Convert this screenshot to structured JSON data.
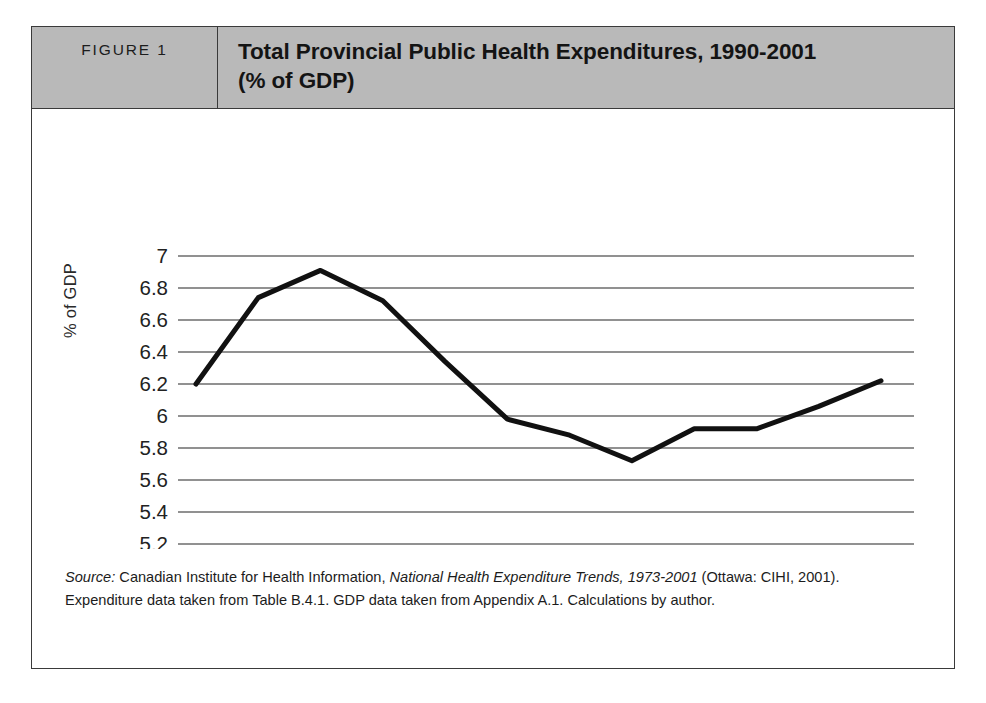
{
  "figure": {
    "label": "FIGURE 1",
    "title_line1": "Total Provincial Public Health Expenditures, 1990-2001",
    "title_line2": "(% of GDP)",
    "header_bg": "#b9b9b9",
    "border_color": "#3a3a3a"
  },
  "source": {
    "lead": "Source:",
    "text_before_italic": " Canadian Institute for Health Information, ",
    "publication": "National Health Expenditure Trends, 1973-2001",
    "text_after_italic": " (Ottawa: CIHI, 2001). Expenditure data taken from Table B.4.1. GDP data taken from Appendix A.1. Calculations by author."
  },
  "chart_data": {
    "type": "line",
    "title": "Total Provincial Public Health Expenditures, 1990-2001 (% of GDP)",
    "xlabel": "",
    "ylabel": "% of GDP",
    "categories": [
      "1990",
      "1991",
      "1992",
      "1993",
      "1994",
      "1995",
      "1996",
      "1997",
      "1998",
      "1999",
      "2000",
      "2001"
    ],
    "values": [
      6.2,
      6.74,
      6.91,
      6.72,
      6.34,
      5.98,
      5.88,
      5.72,
      5.92,
      5.92,
      6.06,
      6.22
    ],
    "series": [
      {
        "name": "Total Provincial Public Health Expenditures (% of GDP)",
        "values": [
          6.2,
          6.74,
          6.91,
          6.72,
          6.34,
          5.98,
          5.88,
          5.72,
          5.92,
          5.92,
          6.06,
          6.22
        ]
      }
    ],
    "ylim": [
      5,
      7
    ],
    "ytick_step": 0.2,
    "ytick_labels": [
      "7",
      "6.8",
      "6.6",
      "6.4",
      "6.2",
      "6",
      "5.8",
      "5.6",
      "5.4",
      "5.2",
      "5"
    ],
    "ytick_values": [
      7,
      6.8,
      6.6,
      6.4,
      6.2,
      6,
      5.8,
      5.6,
      5.4,
      5.2,
      5
    ],
    "grid": true,
    "grid_orientation": "horizontal",
    "legend": false,
    "line_color": "#111111",
    "line_width": 5,
    "grid_color": "#6d6d6d",
    "background": "#ffffff"
  }
}
